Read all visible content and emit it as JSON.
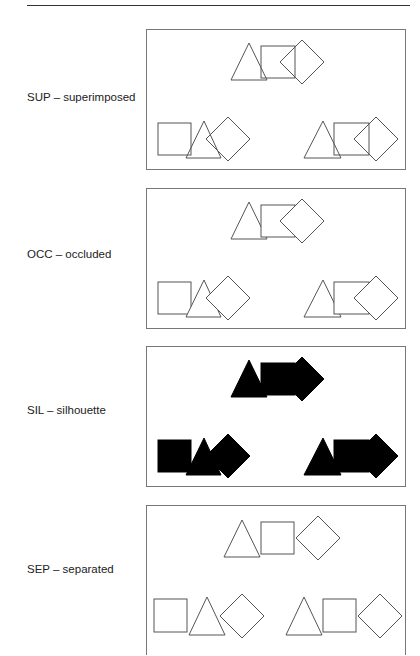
{
  "figure": {
    "conditions": [
      {
        "code": "SUP",
        "name": "superimposed",
        "label": "SUP – superimposed",
        "fill": "none",
        "stroke": "#555555"
      },
      {
        "code": "OCC",
        "name": "occluded",
        "label": "OCC – occluded",
        "fill": "#ffffff",
        "stroke": "#555555"
      },
      {
        "code": "SIL",
        "name": "silhouette",
        "label": "SIL – silhouette",
        "fill": "#000000",
        "stroke": "#000000"
      },
      {
        "code": "SEP",
        "name": "separated",
        "label": "SEP – separated",
        "fill": "none",
        "stroke": "#555555"
      }
    ],
    "shapes": [
      "triangle",
      "square",
      "diamond"
    ],
    "layout": "top group centered; two groups below (left and right)"
  }
}
